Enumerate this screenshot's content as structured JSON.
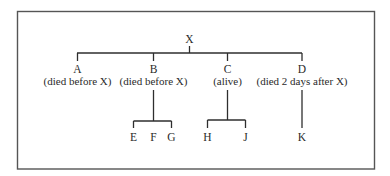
{
  "diagram": {
    "type": "family-tree",
    "root": {
      "name": "X"
    },
    "children": [
      {
        "name": "A",
        "note": "(died before X)",
        "children": []
      },
      {
        "name": "B",
        "note": "(died before X)",
        "children": [
          "E",
          "F",
          "G"
        ]
      },
      {
        "name": "C",
        "note": "(alive)",
        "children": [
          "H",
          "J"
        ]
      },
      {
        "name": "D",
        "note": "(died 2 days after X)",
        "children": [
          "K"
        ]
      }
    ],
    "grandchildren": {
      "E": "E",
      "F": "F",
      "G": "G",
      "H": "H",
      "J": "J",
      "K": "K"
    },
    "colors": {
      "line": "#2e2e2e",
      "frame": "#555555",
      "text": "#2a2a2a",
      "background": "#ffffff"
    }
  }
}
